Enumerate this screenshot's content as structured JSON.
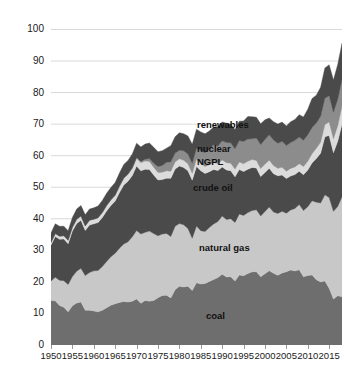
{
  "chart_data": {
    "type": "area",
    "title": "",
    "subtitle": "",
    "xlabel": "",
    "ylabel": "",
    "stacked": true,
    "grid": true,
    "grid_orientation": "horizontal",
    "legend_position": "in-plot-labels",
    "xlim": [
      1950,
      2018
    ],
    "ylim": [
      0,
      103
    ],
    "ytick_labels": [
      "0",
      "10",
      "20",
      "30",
      "40",
      "50",
      "60",
      "70",
      "80",
      "90",
      "100"
    ],
    "ytick_values": [
      0,
      10,
      20,
      30,
      40,
      50,
      60,
      70,
      80,
      90,
      100
    ],
    "xtick_labels": [
      "1950",
      "1955",
      "1960",
      "1965",
      "1970",
      "1975",
      "1980",
      "1985",
      "1990",
      "1995",
      "2000",
      "2005",
      "2010",
      "2015"
    ],
    "xtick_values": [
      1950,
      1955,
      1960,
      1965,
      1970,
      1975,
      1980,
      1985,
      1990,
      1995,
      2000,
      2005,
      2010,
      2015
    ],
    "x": [
      1950,
      1951,
      1952,
      1953,
      1954,
      1955,
      1956,
      1957,
      1958,
      1959,
      1960,
      1961,
      1962,
      1963,
      1964,
      1965,
      1966,
      1967,
      1968,
      1969,
      1970,
      1971,
      1972,
      1973,
      1974,
      1975,
      1976,
      1977,
      1978,
      1979,
      1980,
      1981,
      1982,
      1983,
      1984,
      1985,
      1986,
      1987,
      1988,
      1989,
      1990,
      1991,
      1992,
      1993,
      1994,
      1995,
      1996,
      1997,
      1998,
      1999,
      2000,
      2001,
      2002,
      2003,
      2004,
      2005,
      2006,
      2007,
      2008,
      2009,
      2010,
      2011,
      2012,
      2013,
      2014,
      2015,
      2016,
      2017,
      2018
    ],
    "series": [
      {
        "name": "coal",
        "label": "coal",
        "color": "#6e6e6e",
        "values": [
          14.1,
          14.0,
          12.5,
          12.0,
          10.5,
          12.4,
          13.3,
          13.6,
          11.0,
          11.0,
          10.8,
          10.5,
          11.0,
          11.8,
          12.6,
          13.1,
          13.5,
          13.8,
          13.6,
          13.9,
          14.6,
          13.2,
          14.1,
          13.9,
          14.1,
          14.99,
          15.65,
          15.76,
          14.91,
          17.54,
          18.6,
          18.38,
          18.64,
          17.25,
          19.72,
          19.33,
          19.51,
          20.14,
          20.74,
          21.36,
          22.46,
          21.59,
          21.63,
          20.25,
          22.2,
          21.98,
          22.68,
          23.2,
          23.25,
          21.62,
          22.62,
          23.55,
          22.73,
          22.09,
          22.85,
          23.19,
          23.79,
          23.49,
          23.85,
          21.62,
          22.04,
          22.22,
          20.68,
          19.99,
          20.29,
          17.95,
          14.57,
          15.62,
          15.3
        ],
        "axis_units": "quadrillion Btu"
      },
      {
        "name": "natural gas",
        "label": "natural gas",
        "color": "#c8c8c8",
        "values": [
          6.2,
          7.5,
          8.0,
          8.4,
          8.7,
          9.3,
          10.1,
          10.7,
          11.0,
          12.0,
          12.7,
          13.1,
          13.9,
          14.7,
          15.4,
          16.0,
          17.2,
          18.2,
          19.1,
          20.4,
          21.7,
          22.0,
          21.6,
          22.2,
          21.2,
          19.6,
          19.5,
          19.6,
          19.5,
          20.1,
          19.9,
          19.7,
          18.3,
          16.6,
          18.0,
          16.9,
          16.5,
          17.1,
          17.6,
          17.8,
          18.4,
          18.2,
          18.4,
          18.6,
          19.3,
          19.1,
          19.3,
          19.4,
          19.6,
          19.3,
          19.7,
          20.2,
          19.4,
          19.6,
          19.5,
          18.6,
          19.0,
          19.8,
          20.7,
          21.0,
          21.8,
          23.5,
          24.6,
          25.0,
          27.3,
          28.8,
          27.8,
          28.3,
          31.7
        ],
        "axis_units": "quadrillion Btu"
      },
      {
        "name": "crude oil",
        "label": "crude oil",
        "color": "#4a4a4a",
        "values": [
          11.4,
          12.9,
          13.0,
          13.2,
          12.9,
          14.4,
          15.1,
          15.2,
          14.3,
          15.0,
          14.9,
          15.2,
          15.5,
          16.0,
          16.2,
          16.5,
          17.6,
          18.7,
          19.2,
          19.4,
          20.4,
          20.0,
          20.0,
          19.5,
          18.6,
          17.7,
          17.3,
          17.5,
          18.4,
          18.1,
          18.25,
          18.15,
          18.3,
          18.4,
          18.85,
          18.99,
          18.38,
          17.68,
          17.28,
          16.12,
          15.57,
          15.7,
          15.22,
          14.49,
          14.1,
          13.89,
          13.72,
          13.66,
          13.24,
          12.45,
          12.36,
          12.28,
          12.16,
          11.94,
          11.5,
          10.96,
          10.8,
          10.72,
          10.51,
          11.35,
          11.59,
          11.99,
          13.81,
          15.77,
          18.41,
          19.66,
          18.57,
          20.63,
          23.0
        ],
        "axis_units": "quadrillion Btu"
      },
      {
        "name": "NGPL",
        "label": "NGPL",
        "color": "#dcdcdc",
        "values": [
          0.82,
          0.92,
          1.0,
          1.05,
          1.1,
          1.24,
          1.34,
          1.4,
          1.44,
          1.57,
          1.46,
          1.52,
          1.6,
          1.7,
          1.79,
          1.88,
          2.02,
          2.12,
          2.2,
          2.3,
          2.51,
          2.55,
          2.61,
          2.57,
          2.47,
          2.37,
          2.33,
          2.33,
          2.25,
          2.29,
          2.25,
          2.31,
          2.19,
          2.18,
          2.27,
          2.24,
          2.15,
          2.22,
          2.26,
          2.2,
          2.17,
          2.3,
          2.36,
          2.41,
          2.39,
          2.44,
          2.53,
          2.5,
          2.42,
          2.53,
          2.61,
          2.55,
          2.56,
          2.35,
          2.47,
          2.33,
          2.36,
          2.41,
          2.41,
          2.57,
          2.78,
          2.93,
          3.23,
          3.48,
          3.86,
          4.25,
          4.4,
          4.95,
          5.7
        ],
        "axis_units": "quadrillion Btu"
      },
      {
        "name": "nuclear",
        "label": "nuclear",
        "color": "#8c8c8c",
        "values": [
          0,
          0,
          0,
          0,
          0,
          0,
          0,
          0,
          0,
          0,
          0.01,
          0.02,
          0.03,
          0.04,
          0.04,
          0.04,
          0.06,
          0.09,
          0.13,
          0.15,
          0.24,
          0.41,
          0.58,
          0.91,
          1.27,
          1.9,
          2.11,
          2.7,
          3.02,
          2.78,
          2.74,
          3.01,
          3.13,
          3.2,
          3.55,
          4.08,
          4.38,
          4.91,
          5.59,
          5.6,
          6.1,
          6.42,
          6.48,
          6.41,
          6.84,
          7.08,
          7.09,
          6.6,
          7.07,
          7.61,
          7.86,
          8.03,
          8.14,
          7.96,
          8.22,
          8.16,
          8.21,
          8.46,
          8.43,
          8.35,
          8.43,
          8.26,
          8.06,
          8.24,
          8.33,
          8.34,
          8.43,
          8.42,
          8.44
        ],
        "axis_units": "quadrillion Btu"
      },
      {
        "name": "renewables",
        "label": "renewables",
        "color": "#4a4a4a",
        "values": [
          2.98,
          3.1,
          3.13,
          3.0,
          3.0,
          3.1,
          3.25,
          3.3,
          3.5,
          3.5,
          3.6,
          3.7,
          3.8,
          3.86,
          3.9,
          4.0,
          4.14,
          4.26,
          4.28,
          4.4,
          4.5,
          4.62,
          4.8,
          4.9,
          5.0,
          4.7,
          4.7,
          4.5,
          5.1,
          5.2,
          5.5,
          5.4,
          5.7,
          6.0,
          6.0,
          6.0,
          6.0,
          5.8,
          5.6,
          6.1,
          6.0,
          6.1,
          5.9,
          6.1,
          6.1,
          6.5,
          7.1,
          7.0,
          6.6,
          6.6,
          6.2,
          5.3,
          5.8,
          6.1,
          6.1,
          6.2,
          6.6,
          6.6,
          7.1,
          7.4,
          8.1,
          9.2,
          8.8,
          9.2,
          9.6,
          9.8,
          10.2,
          11.0,
          11.5
        ],
        "axis_units": "quadrillion Btu"
      }
    ],
    "series_labels": [
      {
        "name": "renewables",
        "x_px": 197,
        "y_px": 120
      },
      {
        "name": "nuclear",
        "x_px": 197,
        "y_px": 144
      },
      {
        "name": "NGPL",
        "x_px": 197,
        "y_px": 157
      },
      {
        "name": "crude oil",
        "x_px": 193,
        "y_px": 183
      },
      {
        "name": "natural gas",
        "x_px": 199,
        "y_px": 243
      },
      {
        "name": "coal",
        "x_px": 206,
        "y_px": 311
      }
    ],
    "colors": {
      "coal": "#6e6e6e",
      "natural_gas": "#c8c8c8",
      "crude_oil": "#4a4a4a",
      "ngpl": "#dcdcdc",
      "nuclear": "#8c8c8c",
      "renewables": "#4a4a4a",
      "gridline": "#d9d9d9",
      "axis": "#9a9a9a",
      "text": "#1a1a1a",
      "background": "#ffffff"
    }
  }
}
